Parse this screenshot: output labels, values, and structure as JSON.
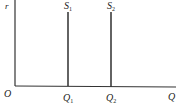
{
  "diagram": {
    "type": "money-supply",
    "y_axis_label": "r",
    "x_axis_label": "Q",
    "origin_label": "O",
    "curves": [
      {
        "label": "S",
        "subscript": "1",
        "quantity_label": "Q",
        "quantity_subscript": "1"
      },
      {
        "label": "S",
        "subscript": "2",
        "quantity_label": "Q",
        "quantity_subscript": "2"
      }
    ],
    "line_color": "#222222"
  }
}
